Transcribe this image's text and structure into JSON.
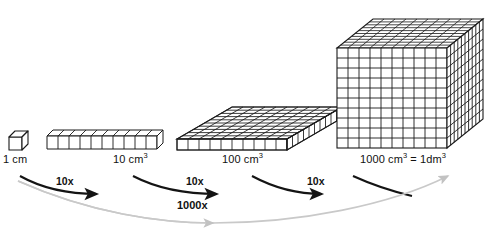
{
  "diagram": {
    "background_color": "#ffffff",
    "line_color": "#1a1a1a",
    "face_fill": "#ffffff",
    "shade_fill": "#d9d9d9",
    "top_fill": "#444444",
    "gray_arrow_color": "#c9c9c9",
    "black_arrow_color": "#141414"
  },
  "shapes": [
    {
      "id": "unit-cube",
      "name": "unit-cube",
      "label": "1 cm",
      "label_unit": "",
      "cubes": 1,
      "dims": "1 x 1 x 1"
    },
    {
      "id": "rod",
      "name": "ten-cube-rod",
      "label": "10 cm",
      "label_unit": "3",
      "cubes": 10,
      "dims": "10 x 1 x 1"
    },
    {
      "id": "flat",
      "name": "hundred-cube-flat",
      "label": "100 cm",
      "label_unit": "3",
      "cubes": 100,
      "dims": "10 x 10 x 1"
    },
    {
      "id": "bigcube",
      "name": "thousand-cube-block",
      "label": "1000 cm",
      "label_unit": "3",
      "label_suffix": " = 1dm",
      "label_suffix_unit": "3",
      "cubes": 1000,
      "dims": "10 x 10 x 10"
    }
  ],
  "step_arrows": [
    {
      "label": "10x",
      "from": "unit-cube",
      "to": "rod"
    },
    {
      "label": "10x",
      "from": "rod",
      "to": "flat"
    },
    {
      "label": "10x",
      "from": "flat",
      "to": "bigcube"
    }
  ],
  "total_arrow": {
    "label": "1000x",
    "from": "unit-cube",
    "to": "bigcube"
  }
}
